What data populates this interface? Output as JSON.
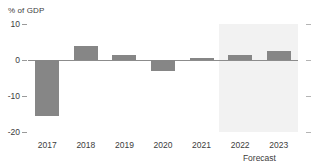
{
  "chart_data": {
    "type": "bar",
    "title": "",
    "subtitle": "",
    "ylabel": "% of GDP",
    "xlabel": "",
    "categories": [
      "2017",
      "2018",
      "2019",
      "2020",
      "2021",
      "2022",
      "2023"
    ],
    "values": [
      -15.5,
      4.0,
      1.5,
      -3.0,
      0.6,
      1.5,
      2.5
    ],
    "series": [
      {
        "name": "",
        "values": [
          -15.5,
          4.0,
          1.5,
          -3.0,
          0.6,
          1.5,
          2.5
        ]
      }
    ],
    "ylim": [
      -20,
      10
    ],
    "yticks": [
      10,
      0,
      -10,
      -20
    ],
    "ytick_labels": [
      "10",
      "0",
      "-10",
      "-20"
    ],
    "grid": false,
    "legend": "none",
    "annotations": [
      {
        "text": "Forecast",
        "covers": [
          "2022",
          "2023"
        ]
      }
    ],
    "bar_color": "#868686",
    "forecast_band_color": "#f2f2f2",
    "axis_color": "#8c8c8c"
  },
  "axis": {
    "y_title": "% of GDP"
  },
  "forecast": {
    "label": "Forecast"
  }
}
